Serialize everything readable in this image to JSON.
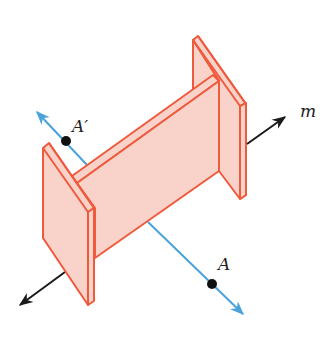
{
  "diagram": {
    "labels": {
      "a_prime": "A′",
      "a": "A",
      "m": "m"
    },
    "colors": {
      "beam_fill": "#f9d3ca",
      "beam_stroke": "#ef5a3c",
      "reflection_line": "#4aa2dc",
      "axis_line": "#1a1a1a",
      "point": "#111111"
    }
  }
}
